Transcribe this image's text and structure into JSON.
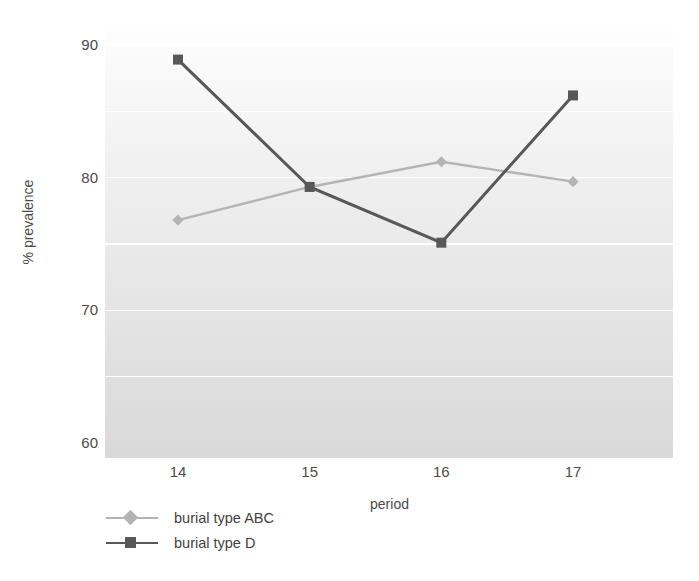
{
  "chart_data": {
    "type": "line",
    "title": "",
    "xlabel": "period",
    "ylabel": "% prevalence",
    "categories": [
      "14",
      "15",
      "16",
      "17"
    ],
    "x": [
      14,
      15,
      16,
      17
    ],
    "xlim": [
      13.5,
      17.5
    ],
    "ylim": [
      60,
      90
    ],
    "yticks": [
      60,
      70,
      80,
      90
    ],
    "ytick_labels": [
      "60",
      "70",
      "80",
      "90"
    ],
    "gridlines_y": [
      65,
      70,
      75,
      80,
      85,
      90
    ],
    "grid": true,
    "grid_color": "#ffffff",
    "legend_position": "below-left",
    "series": [
      {
        "name": "burial type ABC",
        "marker": "diamond",
        "color": "#b4b4b4",
        "values": [
          76.8,
          79.3,
          81.2,
          79.7
        ]
      },
      {
        "name": "burial type D",
        "marker": "square",
        "color": "#585858",
        "values": [
          88.9,
          79.3,
          75.1,
          86.2
        ]
      }
    ]
  },
  "legend": {
    "items": [
      {
        "label": "burial type ABC"
      },
      {
        "label": "burial type D"
      }
    ]
  },
  "colors": {
    "series_abc": "#b4b4b4",
    "series_d": "#585858",
    "gridline": "#ffffff",
    "text": "#4a4a4a",
    "plot_bg_top": "#fdfdfd",
    "plot_bg_bottom": "#d9d9d9"
  }
}
